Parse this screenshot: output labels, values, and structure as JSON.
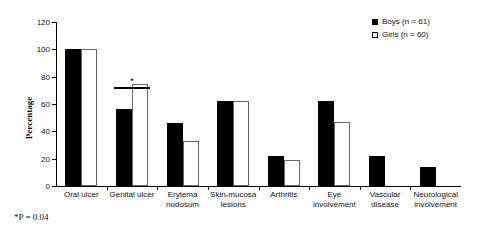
{
  "chart_data": {
    "type": "bar",
    "title": "",
    "xlabel": "",
    "ylabel": "Percentage",
    "ylim": [
      0,
      120
    ],
    "yticks": [
      0,
      20,
      40,
      60,
      80,
      100,
      120
    ],
    "grid": false,
    "legend_position": "top-right",
    "categories": [
      "Oral ulcer",
      "Genital ulcer",
      "Erytema nodosum",
      "Skin-mucosa lesions",
      "Arthritis",
      "Eye involvement",
      "Vascular disease",
      "Neurological involvement"
    ],
    "category_lines": [
      [
        "Oral ulcer"
      ],
      [
        "Genital ulcer"
      ],
      [
        "Erytema",
        "nodosum"
      ],
      [
        "Skin-mucosa",
        "lesions"
      ],
      [
        "Arthritis"
      ],
      [
        "Eye",
        "involvement"
      ],
      [
        "Vascular",
        "disease"
      ],
      [
        "Neurological",
        "involvement"
      ]
    ],
    "series": [
      {
        "name": "Boys (n = 61)",
        "color": "#000000",
        "values": [
          100,
          56,
          46,
          62,
          22,
          62,
          22,
          14
        ]
      },
      {
        "name": "Girls (n = 60)",
        "color": "#ffffff",
        "values": [
          100,
          75,
          33,
          62,
          19,
          47,
          0,
          0
        ]
      }
    ],
    "annotations": [
      {
        "name": "significance-marker",
        "symbol": "*",
        "category": "Genital ulcer",
        "y": 80
      }
    ]
  },
  "legend": {
    "items": [
      {
        "label": "Boys (n = 61)",
        "swatch": "filled-square-icon"
      },
      {
        "label": "Girls (n = 60)",
        "swatch": "open-square-icon"
      }
    ]
  },
  "axis": {
    "y_title": "Percentage",
    "y_ticks": [
      "0",
      "20",
      "40",
      "60",
      "80",
      "100",
      "120"
    ]
  },
  "footnote": "*P = 0.04"
}
